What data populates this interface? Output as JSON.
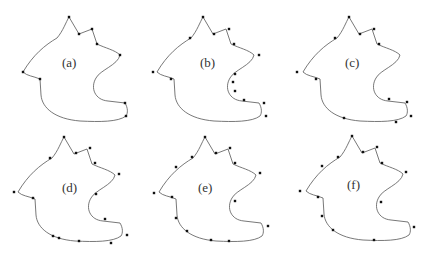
{
  "figure": {
    "panels": [
      {
        "id": "a",
        "label": "(a)",
        "left": 0,
        "top": 0,
        "label_x": 62,
        "label_y": 63,
        "points": [
          [
            69,
            17
          ],
          [
            79,
            34
          ],
          [
            92,
            29
          ],
          [
            97,
            44
          ],
          [
            120,
            55
          ],
          [
            125,
            103
          ],
          [
            126,
            116
          ],
          [
            40,
            79
          ],
          [
            23,
            72
          ]
        ]
      },
      {
        "id": "b",
        "label": "(b)",
        "left": 143,
        "top": 0,
        "label_x": 57,
        "label_y": 63,
        "points": [
          [
            60,
            17
          ],
          [
            71,
            34
          ],
          [
            86,
            29
          ],
          [
            91,
            44
          ],
          [
            116,
            55
          ],
          [
            92,
            74
          ],
          [
            90,
            82
          ],
          [
            92,
            91
          ],
          [
            101,
            100
          ],
          [
            121,
            103
          ],
          [
            123,
            116
          ],
          [
            28,
            79
          ],
          [
            10,
            72
          ],
          [
            47,
            38
          ]
        ]
      },
      {
        "id": "c",
        "label": "(c)",
        "left": 286,
        "top": 0,
        "label_x": 59,
        "label_y": 63,
        "points": [
          [
            63,
            17
          ],
          [
            74,
            34
          ],
          [
            88,
            29
          ],
          [
            93,
            44
          ],
          [
            103,
            99
          ],
          [
            121,
            102
          ],
          [
            125,
            116
          ],
          [
            110,
            122
          ],
          [
            58,
            118
          ],
          [
            30,
            79
          ],
          [
            11,
            72
          ],
          [
            49,
            38
          ]
        ]
      },
      {
        "id": "d",
        "label": "(d)",
        "left": 0,
        "top": 127,
        "label_x": 62,
        "label_y": 61,
        "points": [
          [
            64,
            10
          ],
          [
            76,
            26
          ],
          [
            90,
            21
          ],
          [
            95,
            36
          ],
          [
            119,
            47
          ],
          [
            96,
            67
          ],
          [
            105,
            92
          ],
          [
            127,
            108
          ],
          [
            111,
            116
          ],
          [
            79,
            114
          ],
          [
            59,
            111
          ],
          [
            53,
            109
          ],
          [
            33,
            71
          ],
          [
            14,
            65
          ],
          [
            50,
            31
          ]
        ]
      },
      {
        "id": "e",
        "label": "(e)",
        "left": 143,
        "top": 127,
        "label_x": 55,
        "label_y": 61,
        "points": [
          [
            62,
            10
          ],
          [
            73,
            26
          ],
          [
            87,
            21
          ],
          [
            92,
            36
          ],
          [
            117,
            46
          ],
          [
            92,
            74
          ],
          [
            125,
            99
          ],
          [
            86,
            114
          ],
          [
            68,
            113
          ],
          [
            44,
            104
          ],
          [
            33,
            91
          ],
          [
            29,
            70
          ],
          [
            11,
            66
          ],
          [
            33,
            40
          ],
          [
            49,
            30
          ]
        ]
      },
      {
        "id": "f",
        "label": "(f)",
        "left": 286,
        "top": 127,
        "label_x": 61,
        "label_y": 58,
        "points": [
          [
            66,
            9
          ],
          [
            77,
            25
          ],
          [
            91,
            20
          ],
          [
            96,
            36
          ],
          [
            120,
            45
          ],
          [
            95,
            75
          ],
          [
            128,
            100
          ],
          [
            88,
            113
          ],
          [
            47,
            103
          ],
          [
            36,
            89
          ],
          [
            32,
            70
          ],
          [
            14,
            64
          ],
          [
            36,
            39
          ],
          [
            52,
            30
          ]
        ]
      }
    ]
  }
}
